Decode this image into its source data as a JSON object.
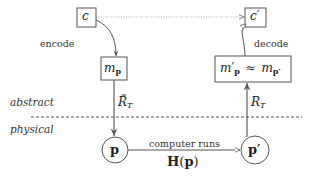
{
  "diagram": {
    "layers": {
      "abstract": "abstract",
      "physical": "physical"
    },
    "nodes": {
      "c": {
        "main": "c"
      },
      "c_prime": {
        "main": "c",
        "prime": "′"
      },
      "m_p": {
        "main": "m",
        "sub": "p"
      },
      "m_p_prime": {
        "left_main": "m",
        "left_prime": "′",
        "left_sub": "p",
        "approx": "≈",
        "right_main": "m",
        "right_sub": "p′"
      },
      "p": {
        "main": "p"
      },
      "p_prime": {
        "main": "p′"
      }
    },
    "edges": {
      "encode": "encode",
      "decode": "decode",
      "r_tilde": {
        "main": "R̃",
        "sub": "T"
      },
      "r": {
        "main": "R",
        "sub": "T"
      },
      "computer_runs": "computer runs",
      "hamiltonian": {
        "main": "H",
        "arg_open": "(",
        "arg": "p",
        "arg_close": ")"
      }
    },
    "colors": {
      "stroke": "#555555",
      "dotted": "#aaaaaa",
      "dashed": "#555555",
      "text": "#222222"
    }
  }
}
